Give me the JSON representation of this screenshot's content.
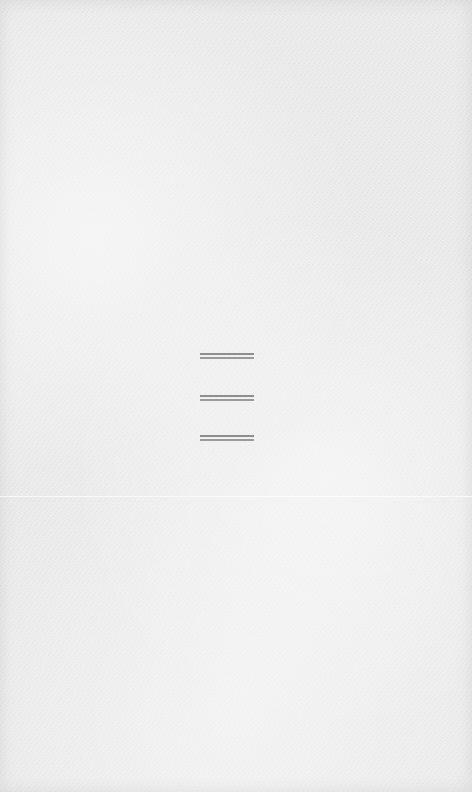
{
  "screen": {
    "background_color": "#ececec",
    "line_color": "#8e8e8e"
  },
  "menu_icon": {
    "icon": "hamburger-menu-icon",
    "bars": 3
  }
}
